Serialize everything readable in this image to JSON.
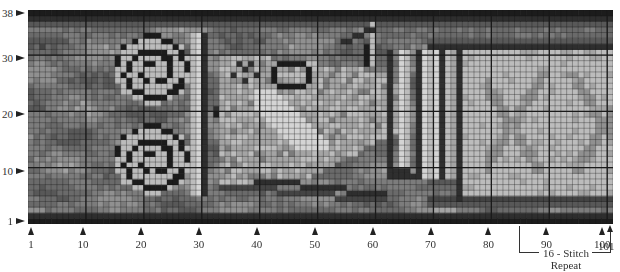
{
  "chart_data": {
    "type": "heatmap",
    "columns": 101,
    "rows": 38,
    "bold_grid_every": 10,
    "row_tick_labels": [
      "1",
      "10",
      "20",
      "30",
      "38"
    ],
    "row_tick_values": [
      1,
      10,
      20,
      30,
      38
    ],
    "column_tick_labels": [
      "1",
      "10",
      "20",
      "30",
      "40",
      "50",
      "60",
      "70",
      "80",
      "90",
      "100",
      "101"
    ],
    "column_tick_values": [
      1,
      10,
      20,
      30,
      40,
      50,
      60,
      70,
      80,
      90,
      100,
      101
    ],
    "annotation": {
      "label_line1": "16 - Stitch",
      "label_line2": "Repeat",
      "from_column": 86,
      "to_column": 101
    },
    "palette": [
      "#1c1c1c",
      "#2e2e2e",
      "#444444",
      "#585858",
      "#6a6a6a",
      "#7c7c7c",
      "#909090",
      "#a4a4a4",
      "#bcbcbc",
      "#d4d4d4"
    ],
    "grid_line_color": "#1a1a1a"
  },
  "y_axis": {
    "labels": [
      {
        "text": "38",
        "row": 38
      },
      {
        "text": "30",
        "row": 30
      },
      {
        "text": "20",
        "row": 20
      },
      {
        "text": "10",
        "row": 10
      },
      {
        "text": "1",
        "row": 1
      }
    ]
  },
  "x_axis": {
    "labels": [
      {
        "text": "1",
        "col": 1
      },
      {
        "text": "10",
        "col": 10
      },
      {
        "text": "20",
        "col": 20
      },
      {
        "text": "30",
        "col": 30
      },
      {
        "text": "40",
        "col": 40
      },
      {
        "text": "50",
        "col": 50
      },
      {
        "text": "60",
        "col": 60
      },
      {
        "text": "70",
        "col": 70
      },
      {
        "text": "80",
        "col": 80
      },
      {
        "text": "90",
        "col": 90
      },
      {
        "text": "100",
        "col": 100
      }
    ],
    "extra_label": {
      "text": "101",
      "col": 101
    }
  },
  "repeat": {
    "line1": "16 - Stitch",
    "line2": "Repeat"
  }
}
